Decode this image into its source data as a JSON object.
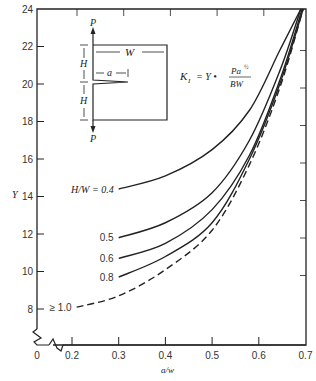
{
  "chart_data": {
    "type": "line",
    "title": "",
    "xlabel": "a/w",
    "ylabel": "Y",
    "xlim": [
      0.2,
      0.7
    ],
    "ylim": [
      8,
      24
    ],
    "x_ticks": [
      "0",
      "0.2",
      "0.3",
      "0.4",
      "0.5",
      "0.6",
      "0.7"
    ],
    "y_ticks": [
      "8",
      "10",
      "12",
      "14",
      "16",
      "18",
      "20",
      "22",
      "24"
    ],
    "axis_breaks": [
      "x",
      "y"
    ],
    "grid": false,
    "formula": {
      "lhs": "K",
      "lhs_sub": "I",
      "mid": "= Y •",
      "numerator": "Pa",
      "numerator_sup": "½",
      "denominator": "BW"
    },
    "inset": {
      "load_label_top": "P",
      "load_label_bottom": "P",
      "width_label": "W",
      "height_label_top": "H",
      "height_label_bottom": "H",
      "crack_label": "a"
    },
    "series": [
      {
        "name": "H/W = 0.4",
        "label": "H/W = 0.4",
        "style": "solid",
        "x": [
          0.3,
          0.4,
          0.5,
          0.58,
          0.645,
          0.69
        ],
        "y": [
          14.4,
          15.1,
          16.5,
          18.6,
          21.8,
          24.0
        ]
      },
      {
        "name": "0.5",
        "label": "0.5",
        "style": "solid",
        "x": [
          0.3,
          0.4,
          0.5,
          0.58,
          0.645,
          0.69
        ],
        "y": [
          11.8,
          12.6,
          14.2,
          17.0,
          20.7,
          24.0
        ]
      },
      {
        "name": "0.6",
        "label": "0.6",
        "style": "solid",
        "x": [
          0.3,
          0.4,
          0.5,
          0.58,
          0.645,
          0.693
        ],
        "y": [
          10.7,
          11.5,
          13.3,
          16.2,
          20.2,
          24.0
        ]
      },
      {
        "name": "0.8",
        "label": "0.8",
        "style": "solid",
        "x": [
          0.3,
          0.4,
          0.5,
          0.58,
          0.645,
          0.695
        ],
        "y": [
          9.7,
          10.8,
          12.6,
          16.0,
          20.0,
          24.0
        ]
      },
      {
        "name": "≥ 1.0",
        "label": "≥ 1.0",
        "style": "dashed",
        "x": [
          0.21,
          0.3,
          0.4,
          0.5,
          0.58,
          0.645,
          0.695
        ],
        "y": [
          8.1,
          8.7,
          10.1,
          12.2,
          15.7,
          19.8,
          24.0
        ]
      }
    ]
  },
  "colors": {
    "ink": "#222222",
    "background": "#ffffff"
  }
}
